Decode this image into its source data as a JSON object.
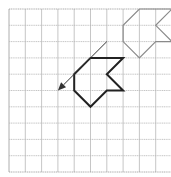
{
  "diagram": {
    "type": "grid-translation",
    "grid": {
      "columns": 10,
      "rows": 10,
      "origin_px": [
        9,
        9
      ],
      "cell_px": 16.3,
      "line_color": "#b8b8b8",
      "border_color": "#999999"
    },
    "image_shape": {
      "label": "translated-shape",
      "color": "#8a8a8a",
      "vertices": [
        [
          8,
          0
        ],
        [
          10,
          0
        ],
        [
          9,
          1
        ],
        [
          10,
          2
        ],
        [
          9,
          2
        ],
        [
          8,
          3
        ],
        [
          7,
          2
        ],
        [
          7,
          1
        ]
      ]
    },
    "original_shape": {
      "label": "original-shape",
      "color": "#222222",
      "vertices": [
        [
          5,
          3
        ],
        [
          7,
          3
        ],
        [
          6,
          4
        ],
        [
          7,
          5
        ],
        [
          6,
          5
        ],
        [
          5,
          6
        ],
        [
          4,
          5
        ],
        [
          4,
          4
        ]
      ]
    },
    "translation_arrow": {
      "from": [
        6,
        2
      ],
      "to": [
        3,
        5
      ],
      "color": "#333333"
    }
  }
}
